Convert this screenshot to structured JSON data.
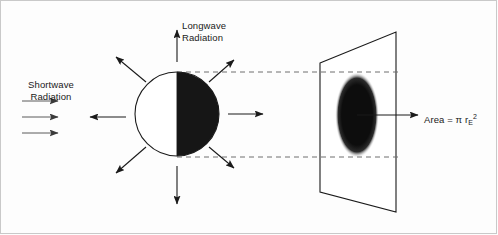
{
  "figure": {
    "background_color": "#fdfdfd",
    "stroke_color": "#1a1a1a",
    "dashed_color": "#6e6e6e",
    "frame_color": "#c9c9c9"
  },
  "labels": {
    "longwave": {
      "line1": "Longwave",
      "line2": "Radiation"
    },
    "shortwave": {
      "line1": "Shortwave",
      "line2": "Radiation"
    },
    "area": {
      "prefix": "Area = ",
      "pi": "π",
      "radius_symbol": " r",
      "subscript": "E",
      "superscript": "2"
    }
  },
  "sphere": {
    "name": "earth-sphere",
    "center_x": 177,
    "center_y": 114,
    "radius": 42,
    "lit_half": "left",
    "lit_color": "#ffffff",
    "dark_color": "#161616",
    "outline_color": "#1a1a1a"
  },
  "projection_plane": {
    "name": "projection-screen",
    "corners": [
      {
        "x": 320,
        "y": 63
      },
      {
        "x": 396,
        "y": 32
      },
      {
        "x": 396,
        "y": 212
      },
      {
        "x": 320,
        "y": 192
      }
    ],
    "fill": "#ffffff",
    "stroke": "#1a1a1a"
  },
  "projected_disk": {
    "name": "projected-area-ellipse",
    "center_x": 357,
    "center_y": 115,
    "rx": 22,
    "ry": 43,
    "fill": "#111111"
  },
  "dashed_lines": [
    {
      "name": "projection-line-top",
      "x1": 177,
      "y1": 72,
      "x2": 398,
      "y2": 72
    },
    {
      "name": "projection-line-bottom",
      "x1": 177,
      "y1": 157,
      "x2": 398,
      "y2": 157
    }
  ],
  "shortwave_arrows": [
    {
      "name": "shortwave-arrow-1",
      "x1": 22,
      "y1": 101,
      "x2": 61,
      "y2": 101
    },
    {
      "name": "shortwave-arrow-2",
      "x1": 22,
      "y1": 117,
      "x2": 61,
      "y2": 117
    },
    {
      "name": "shortwave-arrow-3",
      "x1": 22,
      "y1": 133,
      "x2": 61,
      "y2": 133
    }
  ],
  "longwave_arrows": [
    {
      "name": "longwave-arrow-n",
      "x1": 177,
      "y1": 62,
      "x2": 177,
      "y2": 28
    },
    {
      "name": "longwave-arrow-ne",
      "x1": 209,
      "y1": 82,
      "x2": 236,
      "y2": 58
    },
    {
      "name": "longwave-arrow-e",
      "x1": 228,
      "y1": 114,
      "x2": 265,
      "y2": 114
    },
    {
      "name": "longwave-arrow-se",
      "x1": 209,
      "y1": 146,
      "x2": 236,
      "y2": 170
    },
    {
      "name": "longwave-arrow-s",
      "x1": 177,
      "y1": 166,
      "x2": 177,
      "y2": 206
    },
    {
      "name": "longwave-arrow-sw",
      "x1": 145,
      "y1": 146,
      "x2": 113,
      "y2": 175
    },
    {
      "name": "longwave-arrow-nw",
      "x1": 145,
      "y1": 82,
      "x2": 113,
      "y2": 55
    }
  ],
  "incoming_arrow": {
    "name": "incoming-beam-arrow",
    "x1": 126,
    "y1": 117,
    "x2": 88,
    "y2": 117
  },
  "area_pointer_arrow": {
    "name": "area-pointer-arrow",
    "x1": 357,
    "y1": 115,
    "x2": 420,
    "y2": 115
  }
}
